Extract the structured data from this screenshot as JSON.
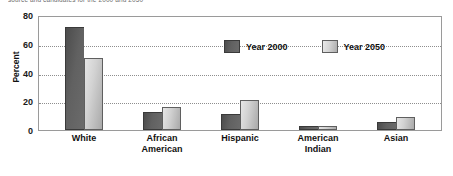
{
  "caption_strip": {
    "text": "source and candidates for the 2000 and 2050"
  },
  "chart_data": {
    "type": "bar",
    "title": "",
    "subtitle": "",
    "xlabel": "",
    "ylabel": "Percent",
    "ylim": [
      0,
      80
    ],
    "yticks": [
      0,
      20,
      40,
      60,
      80
    ],
    "ytick_labels": [
      "0",
      "20",
      "40",
      "60",
      "80"
    ],
    "grid": true,
    "gridlines_at": [
      20,
      40,
      60
    ],
    "legend_position": "inside-upper-center",
    "categories": [
      "White",
      "African American",
      "Hispanic",
      "American Indian",
      "Asian"
    ],
    "category_lines": [
      [
        "White"
      ],
      [
        "African",
        "American"
      ],
      [
        "Hispanic"
      ],
      [
        "American",
        "Indian"
      ],
      [
        "Asian"
      ]
    ],
    "series": [
      {
        "name": "Year 2000",
        "color": "#616161",
        "values": [
          73,
          13,
          11,
          3,
          6
        ]
      },
      {
        "name": "Year 2050",
        "color": "#d2d2d2",
        "values": [
          51,
          16,
          21,
          3,
          9
        ]
      }
    ]
  },
  "colors": {
    "series_2000": "#616161",
    "series_2050": "#d2d2d2",
    "axis": "#9a9a9a",
    "grid": "#8e8e8e",
    "text": "#111111",
    "background": "#ffffff"
  }
}
